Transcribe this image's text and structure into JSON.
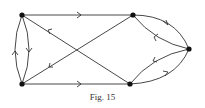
{
  "figure": {
    "caption": "Fig. 15",
    "stroke_color": "#333333",
    "node_color": "#111111"
  },
  "graph": {
    "nodes": [
      {
        "id": "A",
        "label": "",
        "x": 22,
        "y": 15
      },
      {
        "id": "B",
        "label": "",
        "x": 133,
        "y": 15
      },
      {
        "id": "C",
        "label": "",
        "x": 189,
        "y": 49
      },
      {
        "id": "D",
        "label": "",
        "x": 130,
        "y": 84
      },
      {
        "id": "E",
        "label": "",
        "x": 22,
        "y": 84
      }
    ],
    "edges": [
      {
        "from": "A",
        "to": "B",
        "shape": "straight"
      },
      {
        "from": "E",
        "to": "D",
        "shape": "straight"
      },
      {
        "from": "D",
        "to": "A",
        "shape": "straight"
      },
      {
        "from": "B",
        "to": "E",
        "shape": "straight"
      },
      {
        "from": "A",
        "to": "E",
        "shape": "curve-right"
      },
      {
        "from": "E",
        "to": "A",
        "shape": "curve-left"
      },
      {
        "from": "B",
        "to": "C",
        "shape": "curve-outer"
      },
      {
        "from": "C",
        "to": "B",
        "shape": "curve-inner"
      },
      {
        "from": "C",
        "to": "D",
        "shape": "curve-inner"
      },
      {
        "from": "D",
        "to": "C",
        "shape": "curve-outer"
      }
    ]
  }
}
